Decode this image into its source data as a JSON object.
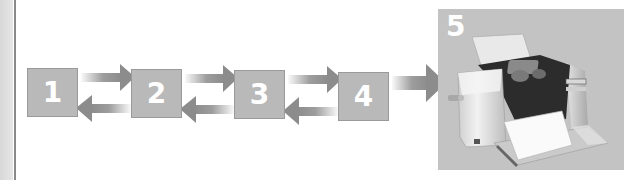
{
  "diagram": {
    "type": "sequential-process-flow",
    "steps": [
      {
        "id": "1",
        "label": "1"
      },
      {
        "id": "2",
        "label": "2"
      },
      {
        "id": "3",
        "label": "3"
      },
      {
        "id": "4",
        "label": "4"
      },
      {
        "id": "5",
        "label": "5",
        "image": "photo-printer"
      }
    ],
    "connections": [
      {
        "from": "1",
        "to": "2",
        "direction": "forward"
      },
      {
        "from": "2",
        "to": "1",
        "direction": "backward"
      },
      {
        "from": "2",
        "to": "3",
        "direction": "forward"
      },
      {
        "from": "3",
        "to": "2",
        "direction": "backward"
      },
      {
        "from": "3",
        "to": "4",
        "direction": "forward"
      },
      {
        "from": "4",
        "to": "3",
        "direction": "backward"
      },
      {
        "from": "4",
        "to": "5",
        "direction": "forward"
      }
    ],
    "colors": {
      "box_fill": "#b9b9b9",
      "arrow": "#8c8c8c",
      "panel_fill": "#c3c3c3",
      "number": "#ffffff"
    }
  }
}
